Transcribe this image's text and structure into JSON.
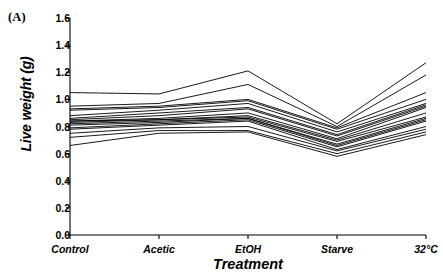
{
  "panel": {
    "label": "(A)"
  },
  "chart_data": {
    "type": "line",
    "title": "",
    "subtitle": "",
    "xlabel": "Treatment",
    "ylabel": "Live weight (g)",
    "categories": [
      "Control",
      "Acetic",
      "EtOH",
      "Starve",
      "32°C"
    ],
    "ylim": [
      0.0,
      1.6
    ],
    "ytick_labels": [
      "0.0",
      "0.2",
      "0.4",
      "0.6",
      "0.8",
      "1.0",
      "1.2",
      "1.4",
      "1.6"
    ],
    "ytick_values": [
      0.0,
      0.2,
      0.4,
      0.6,
      0.8,
      1.0,
      1.2,
      1.4,
      1.6
    ],
    "grid": false,
    "legend": "none",
    "legend_position": "none",
    "line_color": "#000000",
    "series_label": "individual family reaction norm",
    "series": [
      {
        "name": "line-01",
        "values": [
          1.05,
          1.04,
          1.21,
          0.82,
          1.27
        ]
      },
      {
        "name": "line-02",
        "values": [
          0.95,
          0.97,
          1.11,
          0.8,
          1.18
        ]
      },
      {
        "name": "line-03",
        "values": [
          0.93,
          0.95,
          1.0,
          0.79,
          1.05
        ]
      },
      {
        "name": "line-04",
        "values": [
          0.92,
          0.94,
          0.99,
          0.78,
          1.0
        ]
      },
      {
        "name": "line-05",
        "values": [
          0.88,
          0.92,
          0.97,
          0.76,
          0.97
        ]
      },
      {
        "name": "line-06",
        "values": [
          0.86,
          0.9,
          0.94,
          0.74,
          0.96
        ]
      },
      {
        "name": "line-07",
        "values": [
          0.85,
          0.88,
          0.93,
          0.73,
          0.95
        ]
      },
      {
        "name": "line-08",
        "values": [
          0.84,
          0.86,
          0.9,
          0.71,
          0.94
        ]
      },
      {
        "name": "line-09",
        "values": [
          0.84,
          0.85,
          0.88,
          0.7,
          0.9
        ]
      },
      {
        "name": "line-10",
        "values": [
          0.83,
          0.85,
          0.87,
          0.69,
          0.87
        ]
      },
      {
        "name": "line-11",
        "values": [
          0.82,
          0.84,
          0.86,
          0.67,
          0.86
        ]
      },
      {
        "name": "line-12",
        "values": [
          0.81,
          0.83,
          0.86,
          0.66,
          0.85
        ]
      },
      {
        "name": "line-13",
        "values": [
          0.79,
          0.82,
          0.85,
          0.65,
          0.84
        ]
      },
      {
        "name": "line-14",
        "values": [
          0.78,
          0.81,
          0.84,
          0.63,
          0.8
        ]
      },
      {
        "name": "line-15",
        "values": [
          0.75,
          0.79,
          0.8,
          0.62,
          0.78
        ]
      },
      {
        "name": "line-16",
        "values": [
          0.72,
          0.77,
          0.77,
          0.6,
          0.76
        ]
      },
      {
        "name": "line-17",
        "values": [
          0.66,
          0.75,
          0.76,
          0.58,
          0.74
        ]
      }
    ]
  }
}
